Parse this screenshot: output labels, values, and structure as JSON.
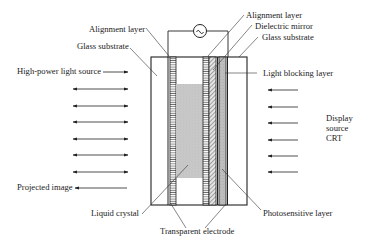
{
  "diagram": {
    "type": "cross-section",
    "colors": {
      "line": "#222222",
      "liquid_crystal_fill": "#c8c8c8",
      "photosensitive_fill": "#bdbdbd",
      "background": "#ffffff"
    },
    "labels": {
      "alignment_layer_left": "Alignment layer",
      "glass_substrate_left": "Glass substrate",
      "high_power_light_source": "High-power light source",
      "projected_image": "Projected image",
      "liquid_crystal": "Liquid crystal",
      "transparent_electrode": "Transparent electrode",
      "alignment_layer_right": "Alignment layer",
      "dielectric_mirror": "Dielectric mirror",
      "glass_substrate_right": "Glass substrate",
      "light_blocking_layer": "Light blocking layer",
      "display_source_line1": "Display",
      "display_source_line2": "source",
      "display_source_line3": "CRT",
      "photosensitive_layer": "Photosensitive layer"
    },
    "ac_source_symbol": "~",
    "left_arrows": {
      "count": 6,
      "direction": "bidirectional"
    },
    "right_arrows": {
      "count": 6,
      "direction": "leftward"
    },
    "layers_left_to_right": [
      "Glass substrate",
      "Transparent electrode",
      "Alignment layer",
      "Liquid crystal",
      "Alignment layer",
      "Dielectric mirror",
      "Light blocking layer",
      "Photosensitive layer",
      "Transparent electrode",
      "Glass substrate"
    ]
  }
}
